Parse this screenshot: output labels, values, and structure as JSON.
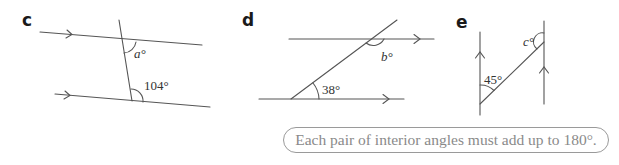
{
  "diagrams": [
    {
      "label": "c",
      "angles": [
        {
          "text": "a°",
          "type": "unknown"
        },
        {
          "text": "104°",
          "type": "given"
        }
      ],
      "parallel_marker": "single arrow"
    },
    {
      "label": "d",
      "angles": [
        {
          "text": "b°",
          "type": "unknown"
        },
        {
          "text": "38°",
          "type": "given"
        }
      ],
      "parallel_marker": "single arrow"
    },
    {
      "label": "e",
      "angles": [
        {
          "text": "c°",
          "type": "unknown"
        },
        {
          "text": "45°",
          "type": "given"
        }
      ],
      "parallel_marker": "single arrow"
    }
  ],
  "hint": {
    "text": "Each pair of interior angles must add up to 180°."
  },
  "colors": {
    "line": "#555555",
    "hint_text": "#8a8a8a",
    "hint_border": "#9a9a9a"
  }
}
